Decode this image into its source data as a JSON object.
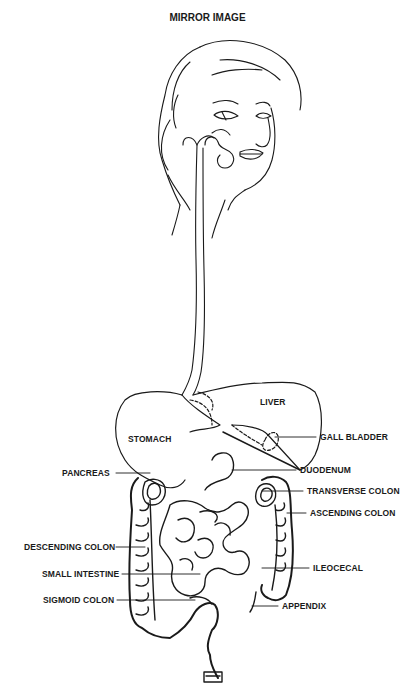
{
  "title": "MIRROR IMAGE",
  "labels": {
    "liver": "LIVER",
    "stomach": "STOMACH",
    "gall_bladder": "GALL BLADDER",
    "pancreas": "PANCREAS",
    "duodenum": "DUODENUM",
    "transverse_colon": "TRANSVERSE COLON",
    "ascending_colon": "ASCENDING COLON",
    "descending_colon": "DESCENDING COLON",
    "small_intestine": "SMALL INTESTINE",
    "ileocecal": "ILEOCECAL",
    "sigmoid_colon": "SIGMOID COLON",
    "appendix": "APPENDIX"
  }
}
